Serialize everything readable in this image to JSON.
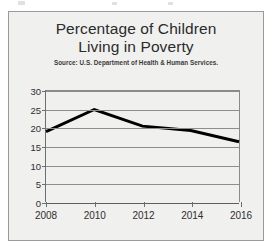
{
  "figure": {
    "title": "Percentage of Children\nLiving in Poverty",
    "source": "Source: U.S. Department of Health & Human Services."
  },
  "chart_data": {
    "type": "line",
    "title": "Percentage of Children Living in Poverty",
    "subtitle": "Source: U.S. Department of Health & Human Services.",
    "xlabel": "",
    "ylabel": "",
    "x": [
      2008,
      2010,
      2012,
      2014,
      2016
    ],
    "categories": [
      "2008",
      "2010",
      "2012",
      "2014",
      "2016"
    ],
    "values": [
      19,
      25,
      20.5,
      19.3,
      16.3
    ],
    "series": [
      {
        "name": "Percentage of Children Living in Poverty",
        "values": [
          19,
          25,
          20.5,
          19.3,
          16.3
        ],
        "color": "#000000"
      }
    ],
    "xlim": [
      2008,
      2016
    ],
    "ylim": [
      0,
      30
    ],
    "yticks": [
      0,
      5,
      10,
      15,
      20,
      25,
      30
    ],
    "ytick_labels": [
      "0",
      "5",
      "10",
      "15",
      "20",
      "25",
      "30"
    ],
    "xticks": [
      2008,
      2010,
      2012,
      2014,
      2016
    ],
    "xtick_labels": [
      "2008",
      "2010",
      "2012",
      "2014",
      "2016"
    ],
    "grid": true,
    "grid_axis": "y",
    "legend": false,
    "legend_position": "none",
    "line_width": 3,
    "markers": false
  },
  "style": {
    "plot_background": "#f0f0ee",
    "frame_color": "#9a9a9a",
    "grid_color": "#8d8d8d",
    "axis_color": "#5e5e5e",
    "line_color": "#000000",
    "text_color": "#2f2f2f"
  }
}
